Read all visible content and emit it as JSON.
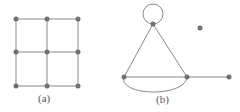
{
  "figures": [
    {
      "label": "(a)",
      "description": "3x3 grid graph",
      "nodes": [
        [
          16,
          19
        ],
        [
          47,
          19
        ],
        [
          78,
          19
        ],
        [
          16,
          52
        ],
        [
          47,
          52
        ],
        [
          78,
          52
        ],
        [
          16,
          86
        ],
        [
          47,
          86
        ],
        [
          78,
          86
        ]
      ]
    },
    {
      "label": "(b)",
      "description": "graph with self-loop, triangle, double edge, pendant and isolated vertex",
      "nodes": [
        [
          153,
          24
        ],
        [
          124,
          77
        ],
        [
          187,
          77
        ],
        [
          229,
          77
        ],
        [
          200,
          28
        ]
      ]
    }
  ],
  "colors": {
    "edge": "#8a8a8a",
    "node": "#707070",
    "label": "#555555"
  }
}
